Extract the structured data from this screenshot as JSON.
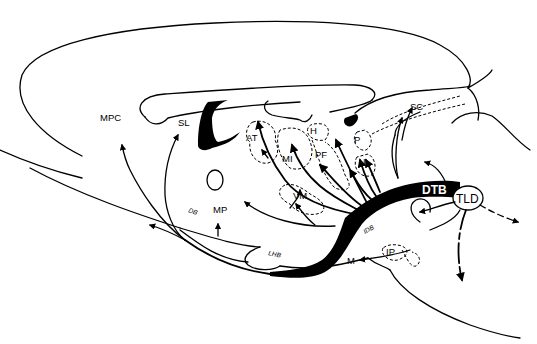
{
  "figure": {
    "labels": {
      "mpc": "MPC",
      "sl": "SL",
      "at": "AT",
      "h": "H",
      "mi": "MI",
      "pf": "PF",
      "p": "P",
      "i": "I",
      "vm": "VM",
      "sc": "SC",
      "dtb": "DTB",
      "tld": "TLD",
      "db": "DB",
      "mp": "MP",
      "lhb": "LHB",
      "idb": "IDB",
      "m": "M",
      "ip": "IP"
    },
    "colors": {
      "line": "#000000",
      "background": "#ffffff"
    }
  }
}
